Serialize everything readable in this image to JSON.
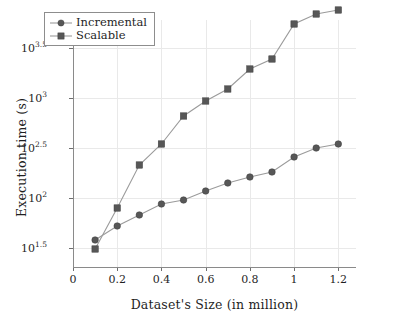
{
  "chart_data": {
    "type": "line",
    "title": "",
    "subtitle": "",
    "xlabel": "Dataset's Size (in million)",
    "ylabel": "Execution time (s)",
    "yscale": "log",
    "xlim": [
      0,
      1.28
    ],
    "ylim_log10": [
      1.3,
      3.78
    ],
    "grid": true,
    "legend_position": "top-left inside",
    "x": [
      0.1,
      0.2,
      0.3,
      0.4,
      0.5,
      0.6,
      0.7,
      0.8,
      0.9,
      1.0,
      1.1,
      1.2
    ],
    "xticks": [
      "0",
      "0.2",
      "0.4",
      "0.6",
      "0.8",
      "1",
      "1.2"
    ],
    "xtick_values": [
      0,
      0.2,
      0.4,
      0.6,
      0.8,
      1.0,
      1.2
    ],
    "yticks": [
      "10^1.5",
      "10^2",
      "10^2.5",
      "10^3",
      "10^3.5"
    ],
    "ytick_log10": [
      1.5,
      2.0,
      2.5,
      3.0,
      3.5
    ],
    "ytick_mantissa": [
      "10",
      "10",
      "10",
      "10",
      "10"
    ],
    "ytick_exponent": [
      "1.5",
      "2",
      "2.5",
      "3",
      "3.5"
    ],
    "series": [
      {
        "name": "Incremental",
        "marker": "circle",
        "color": "#575757",
        "line_color": "#9b9b9b",
        "values": [
          38,
          52,
          68,
          87,
          95,
          117,
          140,
          163,
          183,
          255,
          315,
          350
        ],
        "values_log10": [
          1.58,
          1.72,
          1.83,
          1.94,
          1.98,
          2.07,
          2.15,
          2.21,
          2.26,
          2.41,
          2.5,
          2.54
        ]
      },
      {
        "name": "Scalable",
        "marker": "square",
        "color": "#575757",
        "line_color": "#9b9b9b",
        "values": [
          31,
          79,
          215,
          345,
          655,
          930,
          1230,
          1930,
          2450,
          5500,
          6900,
          7500
        ],
        "values_log10": [
          1.49,
          1.9,
          2.33,
          2.54,
          2.82,
          2.97,
          3.09,
          3.29,
          3.39,
          3.74,
          3.84,
          3.88
        ]
      }
    ]
  },
  "legend": {
    "items": [
      {
        "label": "Incremental",
        "marker": "circle"
      },
      {
        "label": "Scalable",
        "marker": "square"
      }
    ]
  },
  "axes": {
    "x_title": "Dataset's Size (in million)",
    "y_title": "Execution time (s)"
  }
}
